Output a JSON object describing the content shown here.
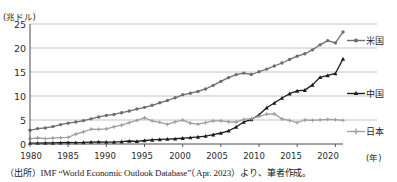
{
  "chart_data": {
    "type": "line",
    "title": "",
    "xlabel": "(年)",
    "ylabel": "(兆ドル)",
    "xlim": [
      1980,
      2022
    ],
    "ylim": [
      0,
      25
    ],
    "yticks": [
      0,
      5,
      10,
      15,
      20,
      25
    ],
    "xticks": [
      1980,
      1985,
      1990,
      1995,
      2000,
      2005,
      2010,
      2015,
      2020
    ],
    "grid": "horizontal",
    "legend_position": "right",
    "x": [
      1980,
      1981,
      1982,
      1983,
      1984,
      1985,
      1986,
      1987,
      1988,
      1989,
      1990,
      1991,
      1992,
      1993,
      1994,
      1995,
      1996,
      1997,
      1998,
      1999,
      2000,
      2001,
      2002,
      2003,
      2004,
      2005,
      2006,
      2007,
      2008,
      2009,
      2010,
      2011,
      2012,
      2013,
      2014,
      2015,
      2016,
      2017,
      2018,
      2019,
      2020,
      2021
    ],
    "series": [
      {
        "name": "米国",
        "color": "#6e6e6e",
        "marker": "circle",
        "values": [
          2.86,
          3.21,
          3.34,
          3.63,
          4.04,
          4.34,
          4.58,
          4.86,
          5.24,
          5.64,
          5.96,
          6.16,
          6.52,
          6.86,
          7.29,
          7.64,
          8.07,
          8.58,
          9.06,
          9.63,
          10.25,
          10.58,
          10.94,
          11.46,
          12.22,
          13.04,
          13.82,
          14.45,
          14.77,
          14.48,
          15.05,
          15.6,
          16.25,
          16.88,
          17.61,
          18.3,
          18.8,
          19.61,
          20.66,
          21.54,
          21.06,
          23.32
        ]
      },
      {
        "name": "中国",
        "color": "#1c1c1c",
        "marker": "triangle",
        "values": [
          0.19,
          0.2,
          0.21,
          0.23,
          0.26,
          0.31,
          0.3,
          0.33,
          0.41,
          0.46,
          0.4,
          0.41,
          0.49,
          0.62,
          0.56,
          0.73,
          0.86,
          0.96,
          1.03,
          1.09,
          1.21,
          1.34,
          1.47,
          1.66,
          1.96,
          2.29,
          2.75,
          3.55,
          4.59,
          5.1,
          6.09,
          7.55,
          8.53,
          9.57,
          10.48,
          11.06,
          11.23,
          12.31,
          13.89,
          14.28,
          14.69,
          17.73
        ]
      },
      {
        "name": "日本",
        "color": "#9f9f9f",
        "marker": "plus",
        "values": [
          1.11,
          1.25,
          1.14,
          1.24,
          1.32,
          1.4,
          2.08,
          2.52,
          3.07,
          3.05,
          3.14,
          3.58,
          3.91,
          4.45,
          4.91,
          5.45,
          4.83,
          4.49,
          4.1,
          4.63,
          4.97,
          4.37,
          4.12,
          4.45,
          4.82,
          4.83,
          4.6,
          4.58,
          5.11,
          5.29,
          5.76,
          6.23,
          6.27,
          5.21,
          4.9,
          4.44,
          5.0,
          4.93,
          5.04,
          5.12,
          5.06,
          4.94
        ]
      }
    ]
  },
  "axis": {
    "y_unit_label": "(兆ドル)",
    "x_unit_label": "(年)",
    "y_tick_labels": [
      "25",
      "20",
      "15",
      "10",
      "5",
      "0"
    ],
    "x_tick_labels": [
      "1980",
      "1985",
      "1990",
      "1995",
      "2000",
      "2005",
      "2010",
      "2015",
      "2020"
    ]
  },
  "legend": {
    "items": [
      {
        "label": "米国"
      },
      {
        "label": "中国"
      },
      {
        "label": "日本"
      }
    ]
  },
  "source": {
    "text": "（出所）IMF “World Economic Outlook Database”（Apr. 2023）より、筆者作成。"
  }
}
